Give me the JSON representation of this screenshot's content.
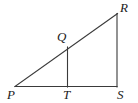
{
  "figure": {
    "type": "geometry-diagram",
    "background_color": "#ffffff",
    "stroke_color": "#3a3a3a",
    "label_color": "#1b1b1b",
    "stroke_width": 1.1,
    "canvas": {
      "width": 138,
      "height": 103
    },
    "points": [
      {
        "id": "P",
        "label": "P",
        "x": 15,
        "y": 86.5,
        "label_x": 7,
        "label_y": 88
      },
      {
        "id": "T",
        "label": "T",
        "x": 67.5,
        "y": 86.5,
        "label_x": 63,
        "label_y": 88
      },
      {
        "id": "S",
        "label": "S",
        "x": 117,
        "y": 86.5,
        "label_x": 117,
        "label_y": 88
      },
      {
        "id": "R",
        "label": "R",
        "x": 117,
        "y": 14,
        "label_x": 120,
        "label_y": 1
      },
      {
        "id": "Q",
        "label": "Q",
        "x": 67.5,
        "y": 48,
        "label_x": 57,
        "label_y": 30
      }
    ],
    "segments": [
      {
        "id": "PS",
        "from": "P",
        "to": "S",
        "x1": 15,
        "y1": 86.5,
        "x2": 117,
        "y2": 86.5
      },
      {
        "id": "PR",
        "from": "P",
        "to": "R",
        "x1": 15,
        "y1": 86.5,
        "x2": 117.5,
        "y2": 13.5
      },
      {
        "id": "RS",
        "from": "R",
        "to": "S",
        "x1": 117,
        "y1": 13.5,
        "x2": 117,
        "y2": 87
      },
      {
        "id": "QT",
        "from": "Q",
        "to": "T",
        "x1": 67.5,
        "y1": 47,
        "x2": 67.5,
        "y2": 87
      }
    ]
  }
}
